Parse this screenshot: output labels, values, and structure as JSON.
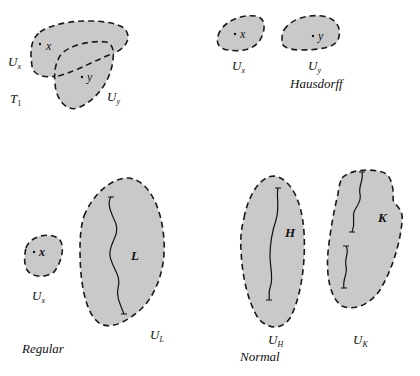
{
  "diagram": {
    "panels": [
      {
        "name": "T1",
        "caption": "T₁",
        "regions": [
          {
            "label": "Uₓ",
            "point": "x"
          },
          {
            "label": "Uᵧ",
            "point": "y"
          }
        ]
      },
      {
        "name": "Hausdorff",
        "caption": "Hausdorff",
        "regions": [
          {
            "label": "Uₓ",
            "point": "x"
          },
          {
            "label": "Uᵧ",
            "point": "y"
          }
        ]
      },
      {
        "name": "Regular",
        "caption": "Regular",
        "regions": [
          {
            "label": "Uₓ",
            "point": "x"
          },
          {
            "label": "Uʟ",
            "set": "L"
          }
        ]
      },
      {
        "name": "Normal",
        "caption": "Normal",
        "regions": [
          {
            "label": "Uʜ",
            "set": "H"
          },
          {
            "label": "Uᴋ",
            "set": "K"
          }
        ]
      }
    ]
  },
  "labels": {
    "t1_ux": "U",
    "t1_ux_sub": "x",
    "t1_uy": "U",
    "t1_uy_sub": "y",
    "t1_x": "x",
    "t1_y": "y",
    "t1_caption": "T",
    "t1_caption_sub": "1",
    "h_x": "x",
    "h_y": "y",
    "h_ux": "U",
    "h_ux_sub": "x",
    "h_uy": "U",
    "h_uy_sub": "y",
    "h_caption": "Hausdorff",
    "r_x": "x",
    "r_ux": "U",
    "r_ux_sub": "x",
    "r_L": "L",
    "r_UL": "U",
    "r_UL_sub": "L",
    "r_caption": "Regular",
    "n_H": "H",
    "n_K": "K",
    "n_UH": "U",
    "n_UH_sub": "H",
    "n_UK": "U",
    "n_UK_sub": "K",
    "n_caption": "Normal"
  },
  "colors": {
    "fill": "#c9c9c9",
    "stroke": "#1a1a1a",
    "background": "#ffffff"
  }
}
